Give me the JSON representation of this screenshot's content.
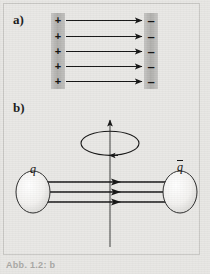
{
  "figure": {
    "background_color": "#e8e7e4",
    "ink_color": "#1b1b1b",
    "plate_color": "#b4b3b0",
    "blob_fill": "#f2f1ef"
  },
  "panels": [
    {
      "id": "a",
      "label": "a)",
      "description": "parallel-plate capacitor with uniform electric field lines",
      "left_plate": {
        "charge_sign": "+",
        "charge_count": 5,
        "charges": [
          "+",
          "+",
          "+",
          "+",
          "+"
        ]
      },
      "right_plate": {
        "charge_sign": "–",
        "charge_count": 5,
        "charges": [
          "–",
          "–",
          "–",
          "–",
          "–"
        ]
      },
      "field_lines": {
        "count": 5,
        "direction": "left-to-right",
        "arrowhead": "right"
      }
    },
    {
      "id": "b",
      "label": "b)",
      "description": "quark-antiquark pair joined by a rotating colour flux tube",
      "left_particle_label": "q",
      "right_particle_label": "q",
      "right_particle_has_overbar": true,
      "flux_tube": {
        "line_count": 3,
        "arrowhead": "right",
        "direction": "left-to-right"
      },
      "rotation_axis": {
        "arrowhead": "up",
        "label": ""
      },
      "rotation_ellipse": {
        "arrowhead": "counterclockwise"
      }
    }
  ],
  "caption": {
    "text": "Abb. 1.2: b"
  }
}
